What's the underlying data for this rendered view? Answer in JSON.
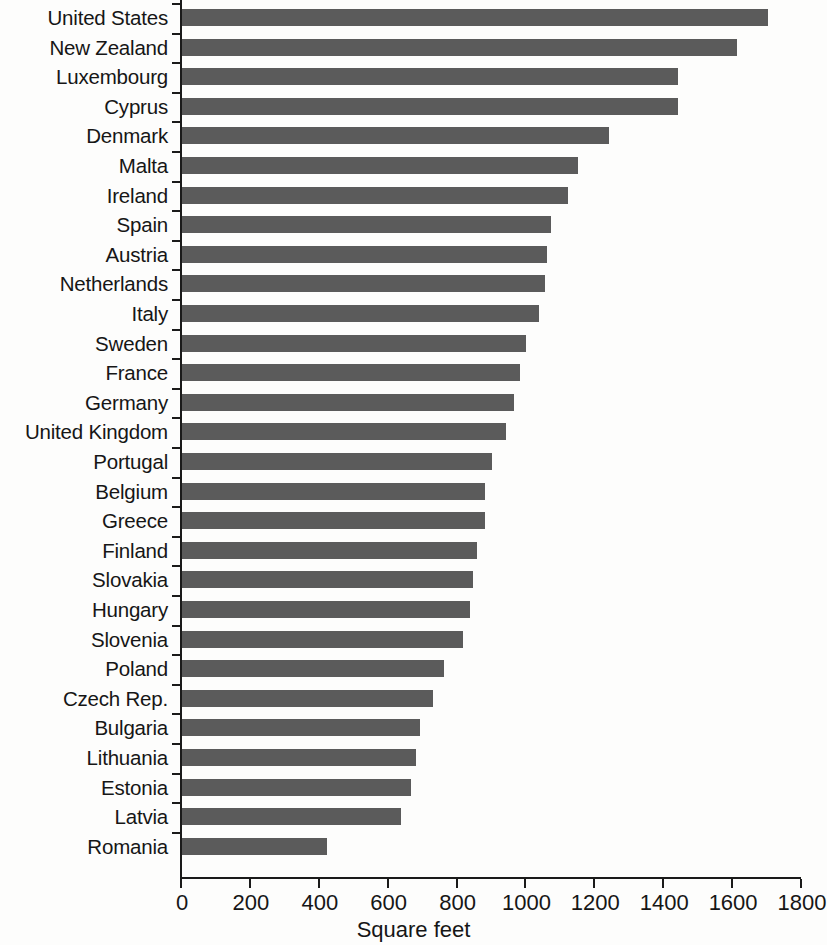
{
  "chart_data": {
    "type": "bar",
    "orientation": "horizontal",
    "title": "",
    "xlabel": "Square feet",
    "ylabel": "",
    "xlim": [
      0,
      1800
    ],
    "xticks": [
      0,
      200,
      400,
      600,
      800,
      1000,
      1200,
      1400,
      1600,
      1800
    ],
    "xtick_labels": [
      "0",
      "200",
      "400",
      "600",
      "800",
      "1000",
      "1200",
      "1400",
      "1600",
      "1800"
    ],
    "grid": false,
    "legend": null,
    "bar_color": "#5b5b5b",
    "background_color": "#fdfdfc",
    "axis_color": "#1a1a1a",
    "categories": [
      "United States",
      "New Zealand",
      "Luxembourg",
      "Cyprus",
      "Denmark",
      "Malta",
      "Ireland",
      "Spain",
      "Austria",
      "Netherlands",
      "Italy",
      "Sweden",
      "France",
      "Germany",
      "United Kingdom",
      "Portugal",
      "Belgium",
      "Greece",
      "Finland",
      "Slovakia",
      "Hungary",
      "Slovenia",
      "Poland",
      "Czech Rep.",
      "Bulgaria",
      "Lithuania",
      "Estonia",
      "Latvia",
      "Romania"
    ],
    "values": [
      1700,
      1610,
      1440,
      1440,
      1240,
      1150,
      1120,
      1070,
      1060,
      1055,
      1035,
      1000,
      980,
      965,
      940,
      900,
      880,
      880,
      855,
      845,
      835,
      815,
      760,
      730,
      690,
      680,
      665,
      635,
      420
    ]
  }
}
